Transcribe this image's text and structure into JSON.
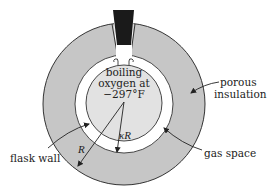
{
  "diagram": {
    "colors": {
      "insulation": "#c6c6c6",
      "oxygen": "#e2e2e2",
      "gas_space": "#ffffff",
      "plug": "#1a1a1a",
      "stroke": "#333333"
    },
    "contents": {
      "line1": "boiling",
      "line2": "oxygen at",
      "line3": "−297°F"
    },
    "labels": {
      "porous_line1": "porous",
      "porous_line2": "insulation",
      "flask_wall": "flask wall",
      "gas_space": "gas space"
    },
    "dimensions": {
      "outer_radius": "R",
      "inner_radius": "κR"
    }
  }
}
